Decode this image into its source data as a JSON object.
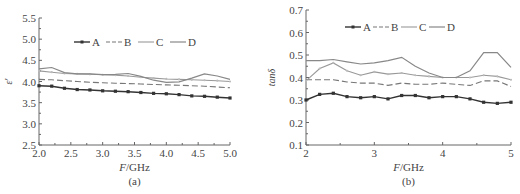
{
  "chart_data": [
    {
      "type": "line",
      "panel_label": "(a)",
      "title": "",
      "xlabel": "F/GHz",
      "ylabel": "ε′",
      "xlim": [
        2.0,
        5.0
      ],
      "ylim": [
        2.5,
        5.5
      ],
      "xticks": [
        "2.0",
        "2.5",
        "3.0",
        "3.5",
        "4.0",
        "4.5",
        "5.0"
      ],
      "yticks": [
        "2.5",
        "3.0",
        "3.5",
        "4.0",
        "4.5",
        "5.0",
        "5.5"
      ],
      "grid": false,
      "legend_position": "top-inside",
      "x": [
        2.0,
        2.2,
        2.4,
        2.6,
        2.8,
        3.0,
        3.2,
        3.4,
        3.6,
        3.8,
        4.0,
        4.2,
        4.4,
        4.6,
        4.8,
        5.0
      ],
      "series": [
        {
          "name": "A",
          "style": "solid-marker",
          "values": [
            3.9,
            3.89,
            3.84,
            3.81,
            3.8,
            3.78,
            3.77,
            3.76,
            3.74,
            3.72,
            3.71,
            3.69,
            3.66,
            3.65,
            3.63,
            3.61
          ]
        },
        {
          "name": "B",
          "style": "dashed",
          "values": [
            4.05,
            4.04,
            4.02,
            4.0,
            3.98,
            3.97,
            3.96,
            3.95,
            3.94,
            3.93,
            3.92,
            3.91,
            3.9,
            3.89,
            3.87,
            3.85
          ]
        },
        {
          "name": "C",
          "style": "solid-light",
          "values": [
            4.25,
            4.22,
            4.19,
            4.18,
            4.17,
            4.16,
            4.15,
            4.13,
            4.1,
            4.08,
            4.06,
            4.05,
            4.04,
            4.03,
            4.02,
            4.0
          ]
        },
        {
          "name": "D",
          "style": "solid",
          "values": [
            4.3,
            4.33,
            4.21,
            4.18,
            4.18,
            4.16,
            4.17,
            4.19,
            4.12,
            4.03,
            3.98,
            3.99,
            4.08,
            4.18,
            4.13,
            4.05
          ]
        }
      ]
    },
    {
      "type": "line",
      "panel_label": "(b)",
      "title": "",
      "xlabel": "F/GHz",
      "ylabel": "tanδ",
      "xlim": [
        2,
        5
      ],
      "ylim": [
        0.1,
        0.7
      ],
      "xticks": [
        "2",
        "3",
        "4",
        "5"
      ],
      "yticks": [
        "0.1",
        "0.2",
        "0.3",
        "0.4",
        "0.5",
        "0.6",
        "0.7"
      ],
      "grid": false,
      "legend_position": "top-inside",
      "x": [
        2.0,
        2.2,
        2.4,
        2.6,
        2.8,
        3.0,
        3.2,
        3.4,
        3.6,
        3.8,
        4.0,
        4.2,
        4.4,
        4.6,
        4.8,
        5.0
      ],
      "series": [
        {
          "name": "A",
          "style": "solid-marker",
          "values": [
            0.3,
            0.325,
            0.33,
            0.315,
            0.31,
            0.315,
            0.305,
            0.32,
            0.32,
            0.31,
            0.315,
            0.315,
            0.305,
            0.29,
            0.285,
            0.29
          ]
        },
        {
          "name": "B",
          "style": "dashed",
          "values": [
            0.39,
            0.39,
            0.39,
            0.38,
            0.375,
            0.375,
            0.365,
            0.375,
            0.37,
            0.37,
            0.375,
            0.37,
            0.365,
            0.385,
            0.385,
            0.36
          ]
        },
        {
          "name": "C",
          "style": "solid-light",
          "values": [
            0.385,
            0.44,
            0.465,
            0.43,
            0.41,
            0.425,
            0.415,
            0.42,
            0.41,
            0.405,
            0.4,
            0.4,
            0.4,
            0.41,
            0.405,
            0.39
          ]
        },
        {
          "name": "D",
          "style": "solid",
          "values": [
            0.475,
            0.475,
            0.48,
            0.47,
            0.46,
            0.465,
            0.475,
            0.49,
            0.45,
            0.42,
            0.4,
            0.4,
            0.43,
            0.51,
            0.51,
            0.445
          ]
        }
      ]
    }
  ],
  "colors": {
    "axis": "#666666",
    "series_A": "#333333",
    "series_B": "#777777",
    "series_C": "#999999",
    "series_D": "#888888",
    "text": "#444444"
  }
}
